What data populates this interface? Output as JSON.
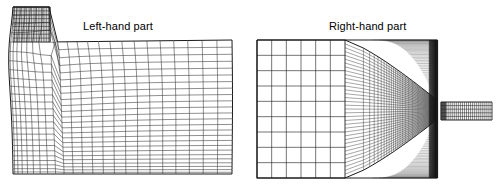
{
  "figure": {
    "kind": "computational-mesh-diagram",
    "width": 501,
    "height": 192,
    "background_color": "#ffffff",
    "line_color": "#1a1a1a",
    "label_color": "#000000",
    "label_font_size_px": 11
  },
  "labels": {
    "left": "Left-hand part",
    "right": "Right-hand part"
  },
  "chart_data": {
    "type": "mesh",
    "title": "",
    "panels": [
      {
        "name": "left-hand-part",
        "label": "Left-hand part",
        "label_x": 83,
        "label_y": 20,
        "bounds": {
          "x0": 13,
          "y0": 7,
          "x1": 232,
          "y1": 174
        },
        "description": "Structured body-fitted mesh with a tall dense vertical inlet block at the upper left, a curved transition fan, and a coarsening grid sweeping to the right boundary.",
        "blocks": [
          {
            "name": "inlet-block",
            "x0": 13,
            "y0": 7,
            "x1": 50,
            "y1": 42,
            "nx": 22,
            "ny": 9,
            "grading_x": "uniform",
            "grading_y": "uniform",
            "density": "dense"
          },
          {
            "name": "transition-fan",
            "x0": 13,
            "y0": 42,
            "x1": 120,
            "y1": 174,
            "nx": 22,
            "ny": 16,
            "grading_x": "clustered-left",
            "grading_y": "clustered-top",
            "density": "medium",
            "curvature": "radial-fan-from-corner"
          },
          {
            "name": "outer-block",
            "x0": 120,
            "y0": 42,
            "x1": 232,
            "y1": 174,
            "nx": 10,
            "ny": 9,
            "grading_x": "coarsening-right",
            "grading_y": "uniform",
            "density": "coarse",
            "skew": "sheared"
          }
        ],
        "corner_point": {
          "x": 50,
          "y": 42
        },
        "boundaries": [
          {
            "name": "top-wall",
            "from": [
              50,
              42
            ],
            "to": [
              232,
              40
            ]
          },
          {
            "name": "inlet-top",
            "from": [
              13,
              7
            ],
            "to": [
              50,
              7
            ]
          },
          {
            "name": "left-wall",
            "from": [
              13,
              7
            ],
            "to": [
              13,
              174
            ]
          },
          {
            "name": "bottom-wall",
            "from": [
              13,
              174
            ],
            "to": [
              232,
              174
            ]
          },
          {
            "name": "outlet",
            "from": [
              232,
              40
            ],
            "to": [
              232,
              174
            ]
          }
        ]
      },
      {
        "name": "right-hand-part",
        "label": "Right-hand part",
        "label_x": 329,
        "label_y": 20,
        "bounds": {
          "x0": 257,
          "y0": 40,
          "x1": 437,
          "y1": 178
        },
        "description": "Rectangular domain: coarse uniform grid on the left, radial lines converging onto a focal point near the right wall, with an extremely dense graded grid at the right boundary and a thin meshed outlet channel protruding to the right.",
        "focal_point": {
          "x": 430,
          "y": 110
        },
        "blocks": [
          {
            "name": "coarse-grid",
            "x0": 257,
            "y0": 40,
            "x1": 345,
            "y1": 178,
            "nx": 6,
            "ny": 9,
            "grading_x": "uniform",
            "grading_y": "uniform",
            "density": "coarse"
          },
          {
            "name": "convergence-fan",
            "x0": 345,
            "y0": 40,
            "x1": 437,
            "y1": 178,
            "nx": 46,
            "ny": 36,
            "grading_x": "strong-clustering-right",
            "grading_y": "clustering-toward-focal",
            "density": "very-dense",
            "curvature": "rays-to-focal-point"
          }
        ],
        "outlet_channel": {
          "name": "outlet-channel",
          "x0": 441,
          "y0": 102,
          "x1": 492,
          "y1": 120,
          "nx": 26,
          "ny": 5,
          "density": "dense"
        },
        "boundaries": [
          {
            "name": "top-wall",
            "from": [
              257,
              40
            ],
            "to": [
              437,
              40
            ]
          },
          {
            "name": "left-inlet",
            "from": [
              257,
              40
            ],
            "to": [
              257,
              178
            ]
          },
          {
            "name": "bottom-wall",
            "from": [
              257,
              178
            ],
            "to": [
              437,
              178
            ]
          },
          {
            "name": "right-wall-upper",
            "from": [
              437,
              40
            ],
            "to": [
              437,
              102
            ]
          },
          {
            "name": "right-wall-lower",
            "from": [
              437,
              120
            ],
            "to": [
              437,
              178
            ]
          }
        ]
      }
    ]
  }
}
